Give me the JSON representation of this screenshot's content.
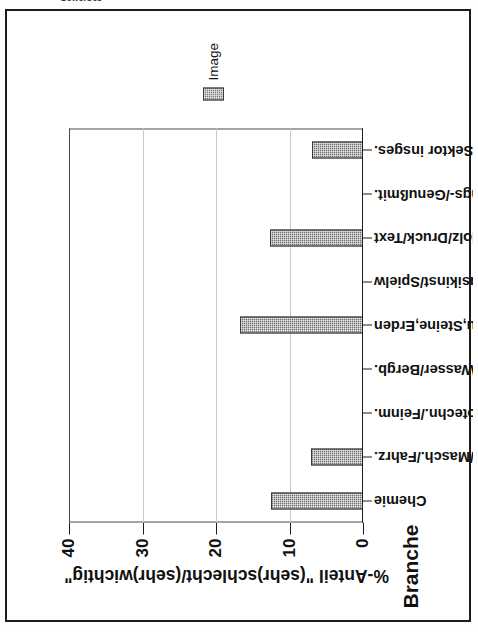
{
  "caption_fragment": "Gewerbes",
  "legend": {
    "position": "right",
    "entries": [
      {
        "label": "Image",
        "color": "#7b7b7b"
      }
    ]
  },
  "axes": {
    "category_axis_title": "Branche",
    "value_axis_title": "%-Anteil \"(sehr)schlecht/(sehr)wichtig\"",
    "value_ticks": [
      "0",
      "10",
      "20",
      "30",
      "40"
    ]
  },
  "chart_data": {
    "type": "bar",
    "title": "",
    "orientation": "vertical-printed-rotated-90ccw",
    "categories": [
      "Chemie",
      "Metall/Masch./Fahrz.",
      "Elektrotechn./Feinm.",
      "Energ./Wasser/Bergb.",
      "Bau,Steine,Erden",
      "EBM/Musikinst/Spielw",
      "Vbrg/Holz/Druck/Text",
      "Nahrungs-/Genußmit.",
      "2. Sektor insges."
    ],
    "series": [
      {
        "name": "Image",
        "color": "#7b7b7b",
        "values": [
          12.5,
          7.1,
          0,
          0,
          16.8,
          0,
          12.6,
          0,
          7.0
        ]
      }
    ],
    "xlabel": "Branche",
    "ylabel": "%-Anteil \"(sehr)schlecht/(sehr)wichtig\"",
    "ylim": [
      0,
      40
    ],
    "yticks": [
      0,
      10,
      20,
      30,
      40
    ],
    "grid": true,
    "legend_position": "right"
  }
}
